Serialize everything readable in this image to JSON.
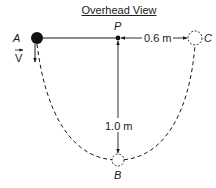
{
  "title": "Overhead View",
  "points": {
    "A": {
      "label": "A",
      "x": 37,
      "y": 38,
      "style": "filled"
    },
    "P": {
      "label": "P",
      "x": 118,
      "y": 38,
      "style": "pivot"
    },
    "B": {
      "label": "B",
      "x": 118,
      "y": 160,
      "style": "dashed"
    },
    "C": {
      "label": "C",
      "x": 195,
      "y": 38,
      "style": "dashed"
    }
  },
  "velocity": {
    "label": "V"
  },
  "dimensions": {
    "pc": "0.6 m",
    "pb": "1.0 m"
  },
  "colors": {
    "ink": "#1a1a1a",
    "background": "#ffffff"
  }
}
